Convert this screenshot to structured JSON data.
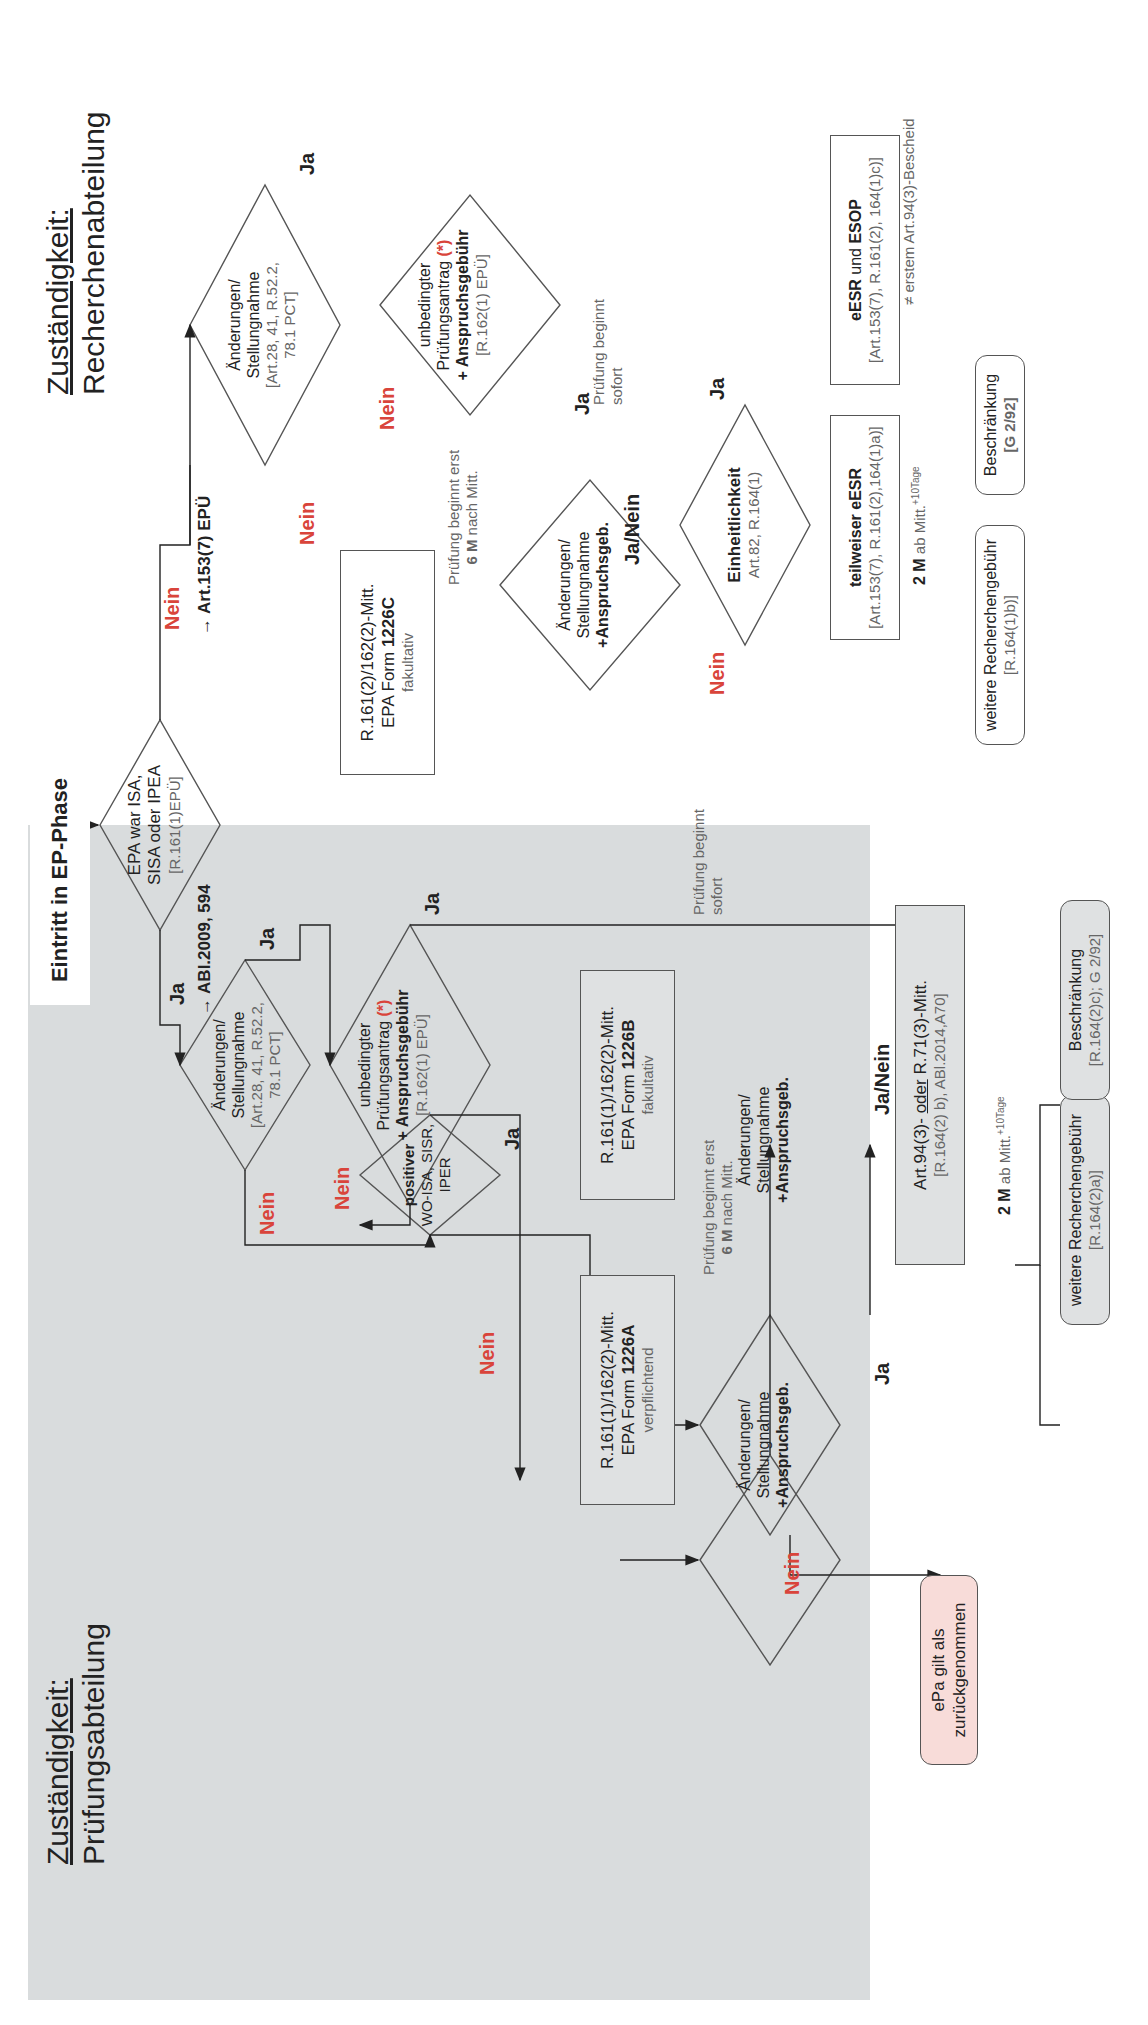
{
  "sections": {
    "left": {
      "heading_underlined": "Zuständigkeit:",
      "heading": "Prüfungsabteilung"
    },
    "right": {
      "heading_underlined": "Zuständigkeit:",
      "heading": "Recherchenabteilung"
    }
  },
  "start": {
    "label": "Eintritt in EP-Phase"
  },
  "decision_root": {
    "line1": "EPA war ISA,",
    "line2": "SISA oder IPEA",
    "ref": "[R.161(1)EPÜ]"
  },
  "left_branch": {
    "ja_label": "Ja",
    "ref_label": "→ ABl.2009, 594",
    "amend_decision": {
      "line1": "Änderungen/",
      "line2": "Stellungnahme",
      "ref1": "[Art.28, 41, R.52.2,",
      "ref2": "78.1 PCT]"
    },
    "amend_ja": "Ja",
    "amend_nein": "Nein",
    "exam_decision": {
      "line1": "unbedingter",
      "line2": "Prüfungsantrag",
      "star": "(*)",
      "line3": "+ Anspruchsgebühr",
      "ref": "[R.162(1) EPÜ]"
    },
    "exam_ja": "Ja",
    "exam_nein": "Nein",
    "exam_ja_note": {
      "line1": "Prüfung beginnt",
      "line2": "sofort"
    },
    "positive_decision": {
      "line1": "positiver",
      "line2": "WO-ISA, SISR,",
      "line3": "IPER"
    },
    "positive_ja": "Ja",
    "positive_nein": "Nein",
    "form_b": {
      "line1": "R.161(1)/162(2)-Mitt.",
      "line2_pre": "EPA Form ",
      "line2_bold": "1226B",
      "line3": "fakultativ"
    },
    "form_a": {
      "line1": "R.161(1)/162(2)-Mitt.",
      "line2_pre": "EPA Form ",
      "line2_bold": "1226A",
      "line3": "verpflichtend"
    },
    "delay_note": {
      "line1": "Prüfung beginnt erst",
      "line2_bold": "6 M",
      "line2_rest": " nach Mitt."
    },
    "amend_b": {
      "line1": "Änderungen/",
      "line2": "Stellungnahme",
      "line3": "+Anspruchsgeb."
    },
    "amend_b_label": "Ja/Nein",
    "amend_a": {
      "line1": "Änderungen/",
      "line2": "Stellungnahme",
      "line3": "+Anspruchsgeb."
    },
    "amend_a_ja": "Ja",
    "amend_a_nein": "Nein",
    "withdrawn": {
      "line1": "ePa gilt als",
      "line2": "zurückgenommen"
    },
    "art94": {
      "line1_pre": "Art.94(3)- ",
      "line1_u": "oder",
      "line1_post": " R.71(3)-Mitt.",
      "ref": "[R.164(2) b), ABl.2014,A70]"
    },
    "deadline": {
      "bold": "2 M",
      "rest": " ab Mitt.",
      "sup": "+10Tage"
    },
    "further_fee": {
      "line1": "weitere Recherchengebühr",
      "ref": "[R.164(2)a)]"
    },
    "restriction": {
      "line1": "Beschränkung",
      "ref": "[R.164(2)c); G 2/92]"
    }
  },
  "right_branch": {
    "nein_label": "Nein",
    "ref_label": "→ Art.153(7) EPÜ",
    "amend_decision": {
      "line1": "Änderungen/",
      "line2": "Stellungnahme",
      "ref1": "[Art.28, 41, R.52.2,",
      "ref2": "78.1 PCT]"
    },
    "amend_ja": "Ja",
    "amend_nein": "Nein",
    "exam_decision": {
      "line1": "unbedingter",
      "line2": "Prüfungsantrag",
      "star": "(*)",
      "line3": "+ Anspruchsgebühr",
      "ref": "[R.162(1) EPÜ]"
    },
    "exam_ja": "Ja",
    "exam_nein": "Nein",
    "form_c": {
      "line1": "R.161(2)/162(2)-Mitt.",
      "line2_pre": "EPA Form ",
      "line2_bold": "1226C",
      "line3": "fakultativ"
    },
    "delay_note": {
      "line1": "Prüfung beginnt erst",
      "line2_bold": "6 M",
      "line2_rest": " nach Mitt."
    },
    "amend_c": {
      "line1": "Änderungen/",
      "line2": "Stellungnahme",
      "line3": "+Anspruchsgeb."
    },
    "amend_c_label": "Ja/Nein",
    "exam_ja_note": {
      "line1": "Prüfung beginnt",
      "line2": "sofort"
    },
    "unity_decision": {
      "line1": "Einheitlichkeit",
      "ref": "Art.82, R.164(1)"
    },
    "unity_ja": "Ja",
    "unity_nein": "Nein",
    "partial_esr": {
      "line1": "teilweiser eESR",
      "ref": "[Art.153(7), R.161(2),164(1)a)]"
    },
    "esr_esop": {
      "line1_b1": "eESR",
      "line1_mid": " und ",
      "line1_b2": "ESOP",
      "ref": "[Art.153(7), R.161(2), 164(1)c)]"
    },
    "esop_note": "≠ erstem Art.94(3)-Bescheid",
    "deadline": {
      "bold": "2 M",
      "rest": " ab Mitt.",
      "sup": "+10Tage"
    },
    "further_fee": {
      "line1": "weitere Recherchengebühr",
      "ref": "[R.164(1)b)]"
    },
    "restriction": {
      "line1": "Beschränkung",
      "ref": "[G 2/92]"
    }
  },
  "colors": {
    "panel": "#d9dcdd",
    "nein": "#d9443b",
    "line": "#555555",
    "withdrawn_fill": "#f8dcd9"
  }
}
